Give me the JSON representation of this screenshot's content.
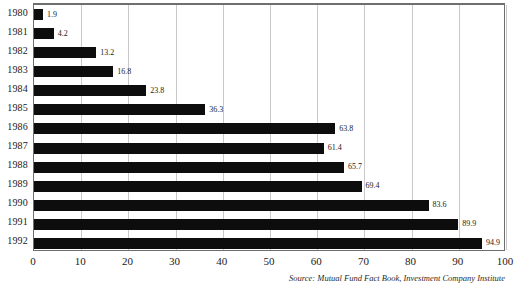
{
  "chart_data": {
    "type": "bar",
    "orientation": "horizontal",
    "title": "",
    "xlabel": "",
    "ylabel": "",
    "categories": [
      "1980",
      "1981",
      "1982",
      "1983",
      "1984",
      "1985",
      "1986",
      "1987",
      "1988",
      "1989",
      "1990",
      "1991",
      "1992"
    ],
    "values": [
      1.9,
      4.2,
      13.2,
      16.8,
      23.8,
      36.3,
      63.8,
      61.4,
      65.7,
      69.4,
      83.6,
      89.9,
      94.9
    ],
    "value_labels": [
      "1.9",
      "4.2",
      "13.2",
      "16.8",
      "23.8",
      "36.3",
      "63.8",
      "61.4",
      "65.7",
      "69.4",
      "83.6",
      "89.9",
      "94.9"
    ],
    "xlim": [
      0,
      100
    ],
    "xticks": [
      0,
      10,
      20,
      30,
      40,
      50,
      60,
      70,
      80,
      90,
      100
    ],
    "xtick_labels": [
      "0",
      "10",
      "20",
      "30",
      "40",
      "50",
      "60",
      "70",
      "80",
      "90",
      "100"
    ],
    "grid": true,
    "grid_axis": "x",
    "legend": false,
    "bar_color": "#0d0d0d",
    "grid_color": "#c9c9c9",
    "frame_color": "#6e6e6e",
    "background": "#ffffff"
  },
  "source": {
    "text": "Source: Mutual Fund Fact Book, Investment Company Institute"
  }
}
